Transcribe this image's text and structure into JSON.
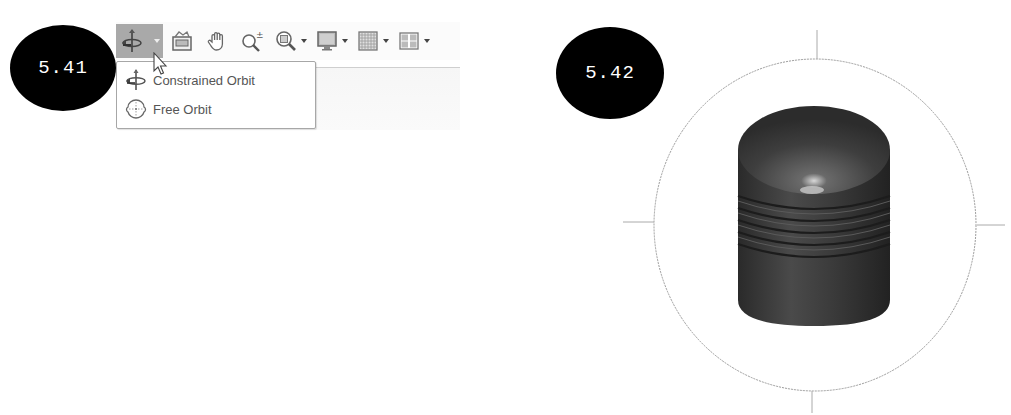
{
  "figures": [
    {
      "label": "5.41"
    },
    {
      "label": "5.42"
    }
  ],
  "toolbar": {
    "buttons": [
      {
        "name": "orbit",
        "icon": "orbit-icon",
        "has_dropdown": true,
        "active": true
      },
      {
        "name": "view-face",
        "icon": "view-face-icon",
        "has_dropdown": false
      },
      {
        "name": "pan",
        "icon": "hand-pan-icon",
        "has_dropdown": false
      },
      {
        "name": "zoom",
        "icon": "zoom-plusminus-icon",
        "has_dropdown": false
      },
      {
        "name": "zoom-window",
        "icon": "zoom-window-icon",
        "has_dropdown": true
      },
      {
        "name": "display-settings",
        "icon": "monitor-icon",
        "has_dropdown": true
      },
      {
        "name": "grid-settings",
        "icon": "grid-icon",
        "has_dropdown": true
      },
      {
        "name": "viewports",
        "icon": "viewports-icon",
        "has_dropdown": true
      }
    ]
  },
  "orbit_menu": {
    "items": [
      {
        "label": "Constrained Orbit",
        "icon": "constrained-orbit-icon"
      },
      {
        "label": "Free Orbit",
        "icon": "free-orbit-icon"
      }
    ]
  },
  "viewport": {
    "object": "ribbed cylindrical knob",
    "orbit_ring": true,
    "colors": {
      "ring": "#9a9a9a",
      "body": "#3a3a3a",
      "highlight": "#d8d8d8"
    }
  }
}
